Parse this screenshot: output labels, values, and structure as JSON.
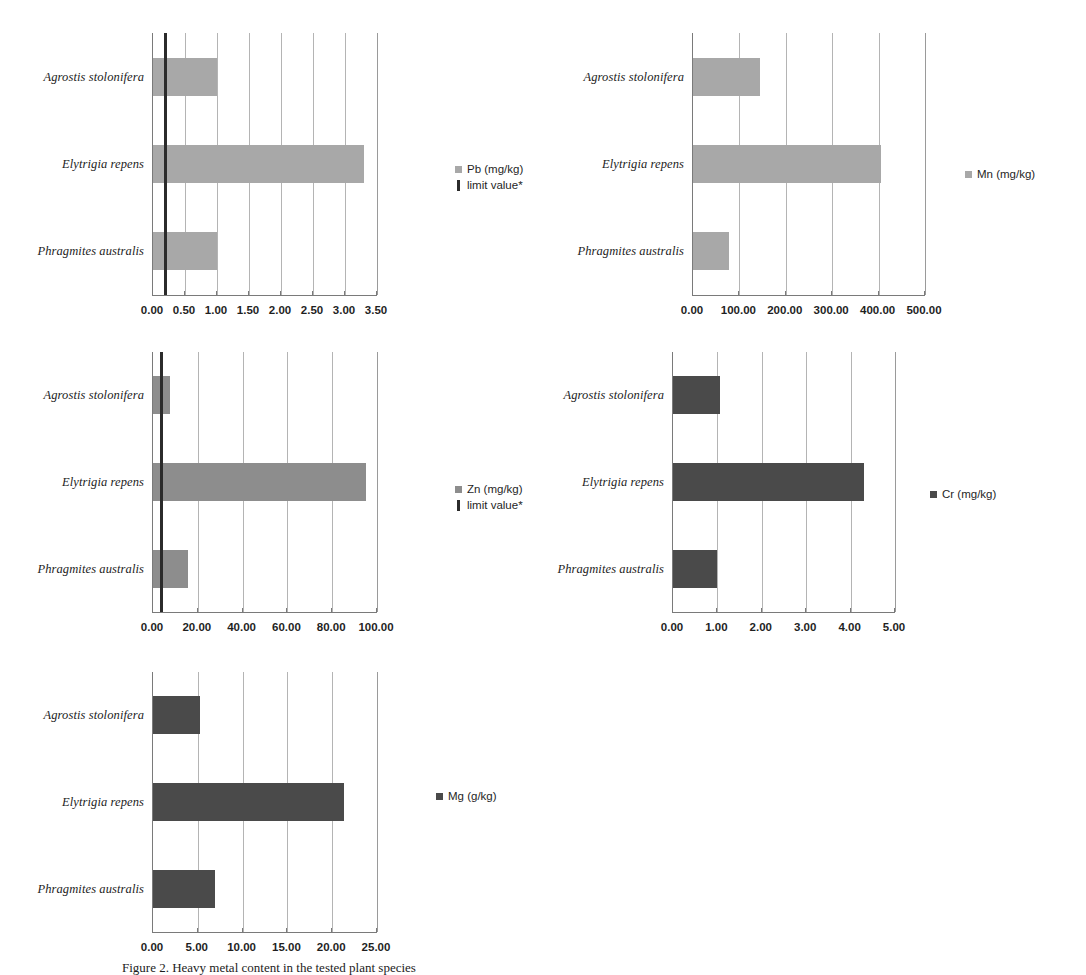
{
  "figure": {
    "caption_partial": "Figure 2. Heavy metal content in the tested plant species",
    "categories": [
      "Agrostis stolonifera",
      "Elytrigia repens",
      "Phragmites australis"
    ],
    "colors": {
      "bar_light": "#a8a8a8",
      "bar_mid": "#8d8d8d",
      "bar_dark": "#4a4a4a",
      "limit_line": "#2b2b2b",
      "gridline": "#b4b4b4",
      "axis": "#7a7a7a"
    },
    "limit_legend_label": "limit value*"
  },
  "chart_data": [
    {
      "id": "pb",
      "type": "bar",
      "orientation": "horizontal",
      "title": "",
      "xlabel": "",
      "ylabel": "",
      "categories": [
        "Agrostis stolonifera",
        "Elytrigia repens",
        "Phragmites australis"
      ],
      "series": [
        {
          "name": "Pb (mg/kg)",
          "values": [
            1.0,
            3.3,
            1.0
          ],
          "color": "#a8a8a8"
        }
      ],
      "limit_value": 0.2,
      "limit_label": "limit value*",
      "xlim": [
        0,
        3.5
      ],
      "xticks": [
        0,
        0.5,
        1.0,
        1.5,
        2.0,
        2.5,
        3.0,
        3.5
      ],
      "xticklabels": [
        "0.00",
        "0.50",
        "1.00",
        "1.50",
        "2.00",
        "2.50",
        "3.00",
        "3.50"
      ],
      "grid": true,
      "legend_position": "right"
    },
    {
      "id": "mn",
      "type": "bar",
      "orientation": "horizontal",
      "title": "",
      "xlabel": "",
      "ylabel": "",
      "categories": [
        "Agrostis stolonifera",
        "Elytrigia repens",
        "Phragmites australis"
      ],
      "series": [
        {
          "name": "Mn (mg/kg)",
          "values": [
            145,
            405,
            78
          ],
          "color": "#a8a8a8"
        }
      ],
      "limit_value": null,
      "xlim": [
        0,
        500
      ],
      "xticks": [
        0,
        100,
        200,
        300,
        400,
        500
      ],
      "xticklabels": [
        "0.00",
        "100.00",
        "200.00",
        "300.00",
        "400.00",
        "500.00"
      ],
      "grid": true,
      "legend_position": "right"
    },
    {
      "id": "zn",
      "type": "bar",
      "orientation": "horizontal",
      "title": "",
      "xlabel": "",
      "ylabel": "",
      "categories": [
        "Agrostis stolonifera",
        "Elytrigia repens",
        "Phragmites australis"
      ],
      "series": [
        {
          "name": "Zn (mg/kg)",
          "values": [
            7.5,
            95.0,
            15.5
          ],
          "color": "#8d8d8d"
        }
      ],
      "limit_value": 4.0,
      "limit_label": "limit value*",
      "xlim": [
        0,
        100
      ],
      "xticks": [
        0,
        20,
        40,
        60,
        80,
        100
      ],
      "xticklabels": [
        "0.00",
        "20.00",
        "40.00",
        "60.00",
        "80.00",
        "100.00"
      ],
      "grid": true,
      "legend_position": "right"
    },
    {
      "id": "cr",
      "type": "bar",
      "orientation": "horizontal",
      "title": "",
      "xlabel": "",
      "ylabel": "",
      "categories": [
        "Agrostis stolonifera",
        "Elytrigia repens",
        "Phragmites australis"
      ],
      "series": [
        {
          "name": "Cr (mg/kg)",
          "values": [
            1.05,
            4.3,
            1.0
          ],
          "color": "#4a4a4a"
        }
      ],
      "limit_value": null,
      "xlim": [
        0,
        5
      ],
      "xticks": [
        0,
        1,
        2,
        3,
        4,
        5
      ],
      "xticklabels": [
        "0.00",
        "1.00",
        "2.00",
        "3.00",
        "4.00",
        "5.00"
      ],
      "grid": true,
      "legend_position": "right"
    },
    {
      "id": "mg",
      "type": "bar",
      "orientation": "horizontal",
      "title": "",
      "xlabel": "",
      "ylabel": "",
      "categories": [
        "Agrostis stolonifera",
        "Elytrigia repens",
        "Phragmites australis"
      ],
      "series": [
        {
          "name": "Mg (g/kg)",
          "values": [
            5.2,
            21.3,
            6.9
          ],
          "color": "#4a4a4a"
        }
      ],
      "limit_value": null,
      "xlim": [
        0,
        25
      ],
      "xticks": [
        0,
        5,
        10,
        15,
        20,
        25
      ],
      "xticklabels": [
        "0.00",
        "5.00",
        "10.00",
        "15.00",
        "20.00",
        "25.00"
      ],
      "grid": true,
      "legend_position": "right"
    }
  ]
}
